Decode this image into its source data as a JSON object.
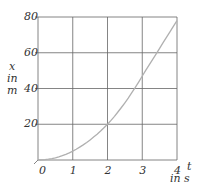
{
  "chart_data": {
    "type": "line",
    "title": "",
    "xlabel": "t in s",
    "ylabel": "x in m",
    "x": [
      0,
      1,
      2,
      3,
      4
    ],
    "series": [
      {
        "name": "x(t)",
        "values": [
          0,
          5,
          20,
          47,
          78
        ]
      }
    ],
    "xticks": [
      "0",
      "1",
      "2",
      "3",
      "4"
    ],
    "yticks": [
      "20",
      "40",
      "60",
      "80"
    ],
    "xlim": [
      0,
      4
    ],
    "ylim": [
      0,
      80
    ],
    "grid": true,
    "colors": {
      "grid": "#555555",
      "curve": "#b0b0b0"
    }
  },
  "axes": {
    "y_label_lines": [
      "x",
      "in",
      "m"
    ],
    "x_label_lines": [
      "t",
      "in s"
    ]
  }
}
